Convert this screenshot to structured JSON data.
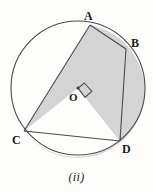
{
  "figure": {
    "caption": "(ii)",
    "background_color": "#fdfdfc",
    "stroke_color": "#4a4a4a",
    "shaded_fill": "#d4d4d4",
    "unshaded_fill": "#fdfdfc",
    "label_color": "#1b1b1b",
    "circle": {
      "center_x": 78,
      "center_y": 88,
      "radius": 67,
      "center_label": "O",
      "center_label_x": 69,
      "center_label_y": 92
    },
    "points": [
      {
        "label": "A",
        "x": 90,
        "y": 25,
        "label_x": 84,
        "label_y": 10
      },
      {
        "label": "B",
        "x": 126,
        "y": 49,
        "label_x": 131,
        "label_y": 37
      },
      {
        "label": "C",
        "x": 24,
        "y": 131,
        "label_x": 12,
        "label_y": 134
      },
      {
        "label": "D",
        "x": 120,
        "y": 141,
        "label_x": 122,
        "label_y": 143
      }
    ],
    "chords": [
      {
        "name": "chord-a-c",
        "from": "A",
        "to": "C"
      },
      {
        "name": "chord-b-d",
        "from": "B",
        "to": "D"
      },
      {
        "name": "chord-a-b",
        "from": "A",
        "to": "B"
      },
      {
        "name": "chord-c-d",
        "from": "C",
        "to": "D"
      }
    ],
    "right_angle_marker": {
      "label": "right-angle-at-O",
      "size": 11
    },
    "shaded_regions": [
      {
        "name": "major-segment-left",
        "description": "region left of chord AC"
      },
      {
        "name": "sector-b-o-d",
        "description": "sector between radii OB and OD"
      }
    ],
    "caption_y": 171
  }
}
